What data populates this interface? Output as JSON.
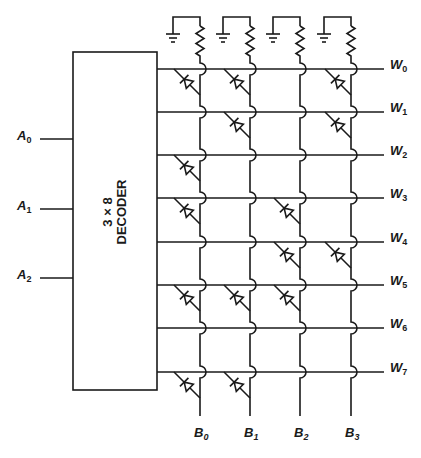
{
  "diagram": {
    "decoder": {
      "line1": "3 × 8",
      "line2": "DECODER"
    },
    "address_inputs": [
      {
        "name": "A",
        "sub": "0",
        "y": 139
      },
      {
        "name": "A",
        "sub": "1",
        "y": 209
      },
      {
        "name": "A",
        "sub": "2",
        "y": 278
      }
    ],
    "word_lines": [
      {
        "name": "W",
        "sub": "0",
        "y": 69
      },
      {
        "name": "W",
        "sub": "1",
        "y": 112
      },
      {
        "name": "W",
        "sub": "2",
        "y": 155
      },
      {
        "name": "W",
        "sub": "3",
        "y": 198
      },
      {
        "name": "W",
        "sub": "4",
        "y": 242
      },
      {
        "name": "W",
        "sub": "5",
        "y": 285
      },
      {
        "name": "W",
        "sub": "6",
        "y": 328
      },
      {
        "name": "W",
        "sub": "7",
        "y": 372
      }
    ],
    "bit_lines": [
      {
        "name": "B",
        "sub": "0",
        "x": 200
      },
      {
        "name": "B",
        "sub": "1",
        "x": 250
      },
      {
        "name": "B",
        "sub": "2",
        "x": 300
      },
      {
        "name": "B",
        "sub": "3",
        "x": 351
      }
    ],
    "diodes": [
      [
        1,
        1,
        0,
        1
      ],
      [
        0,
        1,
        0,
        1
      ],
      [
        1,
        0,
        0,
        0
      ],
      [
        1,
        0,
        1,
        0
      ],
      [
        0,
        0,
        1,
        1
      ],
      [
        1,
        1,
        1,
        0
      ],
      [
        0,
        0,
        0,
        0
      ],
      [
        1,
        1,
        0,
        0
      ]
    ],
    "colors": {
      "line": "#1a1a1a",
      "background": "#ffffff"
    }
  }
}
